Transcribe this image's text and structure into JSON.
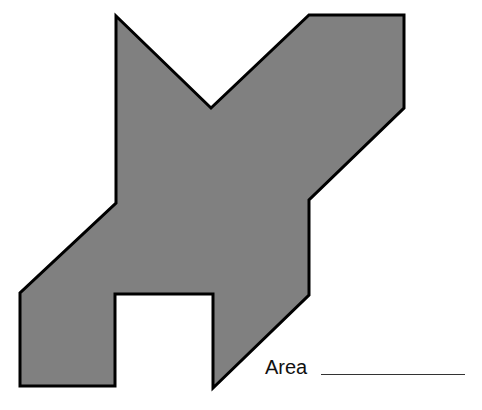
{
  "figure": {
    "type": "polygon",
    "fill_color": "#808080",
    "stroke_color": "#000000"
  },
  "answer": {
    "label": "Area",
    "value": ""
  }
}
